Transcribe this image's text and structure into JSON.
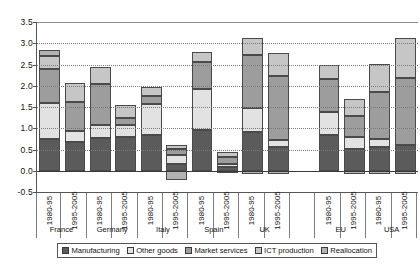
{
  "chart_data": {
    "type": "bar",
    "title": "",
    "subtitle": "",
    "xlabel": "",
    "ylabel": "",
    "stacked": true,
    "grid": true,
    "legend_position": "bottom",
    "ylim": [
      -0.5,
      3.5
    ],
    "ytick_labels": [
      "3.5",
      "3.0",
      "2.5",
      "2.0",
      "1.5",
      "1.0",
      "0.5",
      "0.0",
      "-0.5"
    ],
    "ytick_values": [
      3.5,
      3.0,
      2.5,
      2.0,
      1.5,
      1.0,
      0.5,
      0.0,
      -0.5
    ],
    "legend": [
      {
        "label": "Manufacturing",
        "color": "#5b5b5b"
      },
      {
        "label": "Other goods",
        "color": "#e2e2e2"
      },
      {
        "label": "Market services",
        "color": "#9d9d9d"
      },
      {
        "label": "ICT production",
        "color": "#c6c6c6"
      },
      {
        "label": "Reallocation",
        "color": "#b3b3b3"
      }
    ],
    "series_names": [
      "Manufacturing",
      "Other goods",
      "Market services",
      "ICT production",
      "Reallocation"
    ],
    "countries": [
      "France",
      "Germany",
      "Italy",
      "Spain",
      "UK",
      "EU",
      "USA"
    ],
    "periods": [
      "1980-95",
      "1995-2005"
    ],
    "groups": [
      {
        "country": "France",
        "bars": [
          {
            "period": "1980-95",
            "values": {
              "Manufacturing": 0.75,
              "Other goods": 0.85,
              "Market services": 0.8,
              "ICT production": 0.3,
              "Reallocation": 0.13
            },
            "total": 2.83
          },
          {
            "period": "1995-2005",
            "values": {
              "Manufacturing": 0.68,
              "Other goods": 0.25,
              "Market services": 0.68,
              "ICT production": 0.45,
              "Reallocation": 0.0
            },
            "total": 2.06
          }
        ]
      },
      {
        "country": "Germany",
        "bars": [
          {
            "period": "1980-95",
            "values": {
              "Manufacturing": 0.78,
              "Other goods": 0.3,
              "Market services": 0.95,
              "ICT production": 0.4,
              "Reallocation": 0.0
            },
            "total": 2.43
          },
          {
            "period": "1995-2005",
            "values": {
              "Manufacturing": 0.8,
              "Other goods": 0.28,
              "Market services": 0.17,
              "ICT production": 0.3,
              "Reallocation": 0.0
            },
            "total": 1.55
          }
        ]
      },
      {
        "country": "Italy",
        "bars": [
          {
            "period": "1980-95",
            "values": {
              "Manufacturing": 0.85,
              "Other goods": 0.72,
              "Market services": 0.2,
              "ICT production": 0.2,
              "Reallocation": 0.0
            },
            "total": 1.97
          },
          {
            "period": "1995-2005",
            "values": {
              "Manufacturing": 0.17,
              "Other goods": 0.2,
              "Market services": 0.14,
              "ICT production": 0.1,
              "Reallocation": -0.22
            },
            "total": 0.39
          }
        ]
      },
      {
        "country": "Spain",
        "bars": [
          {
            "period": "1980-95",
            "values": {
              "Manufacturing": 0.97,
              "Other goods": 0.95,
              "Market services": 0.63,
              "ICT production": 0.25,
              "Reallocation": 0.0
            },
            "total": 2.8
          },
          {
            "period": "1995-2005",
            "values": {
              "Manufacturing": 0.1,
              "Other goods": 0.05,
              "Market services": 0.18,
              "ICT production": 0.12,
              "Reallocation": -0.05
            },
            "total": 0.4
          }
        ]
      },
      {
        "country": "UK",
        "bars": [
          {
            "period": "1980-95",
            "values": {
              "Manufacturing": 0.92,
              "Other goods": 0.55,
              "Market services": 1.25,
              "ICT production": 0.4,
              "Reallocation": -0.07
            },
            "total": 3.12
          },
          {
            "period": "1995-2005",
            "values": {
              "Manufacturing": 0.55,
              "Other goods": 0.18,
              "Market services": 1.5,
              "ICT production": 0.53,
              "Reallocation": -0.08
            },
            "total": 2.76
          }
        ]
      },
      {
        "country": "EU",
        "bars": [
          {
            "period": "1980-95",
            "values": {
              "Manufacturing": 0.85,
              "Other goods": 0.53,
              "Market services": 0.77,
              "ICT production": 0.35,
              "Reallocation": 0.0
            },
            "total": 2.5
          },
          {
            "period": "1995-2005",
            "values": {
              "Manufacturing": 0.52,
              "Other goods": 0.27,
              "Market services": 0.5,
              "ICT production": 0.4,
              "Reallocation": -0.07
            },
            "total": 1.69
          }
        ]
      },
      {
        "country": "USA",
        "bars": [
          {
            "period": "1980-95",
            "values": {
              "Manufacturing": 0.55,
              "Other goods": 0.2,
              "Market services": 1.1,
              "ICT production": 0.67,
              "Reallocation": -0.07
            },
            "total": 2.52
          },
          {
            "period": "1995-2005",
            "values": {
              "Manufacturing": 0.6,
              "Other goods": 0.0,
              "Market services": 1.58,
              "ICT production": 0.95,
              "Reallocation": -0.08
            },
            "total": 3.13
          }
        ]
      }
    ]
  }
}
